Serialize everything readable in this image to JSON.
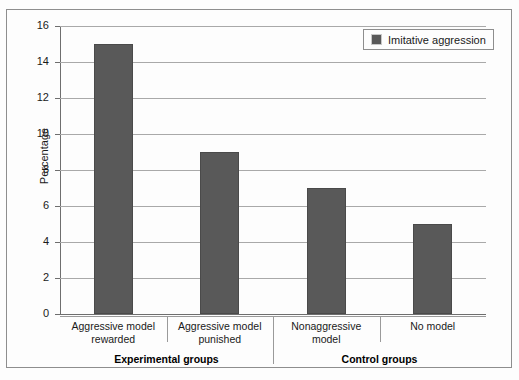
{
  "chart_data": {
    "type": "bar",
    "title": "",
    "subtitle": "",
    "xlabel": "",
    "ylabel": "Percentage",
    "ylim": [
      0,
      16
    ],
    "ytick_step": 2,
    "yticks": [
      0,
      2,
      4,
      6,
      8,
      10,
      12,
      14,
      16
    ],
    "grid": true,
    "legend_position": "top-right",
    "categories": [
      "Aggressive model rewarded",
      "Aggressive model punished",
      "Nonaggressive model",
      "No model"
    ],
    "category_lines": [
      [
        "Aggressive model",
        "rewarded"
      ],
      [
        "Aggressive model",
        "punished"
      ],
      [
        "Nonaggressive",
        "model"
      ],
      [
        "No model"
      ]
    ],
    "series": [
      {
        "name": "Imitative aggression",
        "color": "#595959",
        "values": [
          15,
          9,
          7,
          5
        ]
      }
    ],
    "groups": [
      {
        "label": "Experimental groups",
        "categories": [
          "Aggressive model rewarded",
          "Aggressive model punished"
        ]
      },
      {
        "label": "Control groups",
        "categories": [
          "Nonaggressive model",
          "No model"
        ]
      }
    ]
  },
  "legend": {
    "entries": [
      {
        "label": "Imitative aggression",
        "color": "#595959",
        "swatch_icon": "filled-square-icon"
      }
    ]
  },
  "axes": {
    "y": {
      "title": "Percentage",
      "tick_labels": [
        "0",
        "2",
        "4",
        "6",
        "8",
        "10",
        "12",
        "14",
        "16"
      ]
    }
  },
  "colors": {
    "bar_fill": "#595959",
    "bar_stroke": "#4a4a4a",
    "gridline": "#a9a9a9",
    "axis": "#6e6e6e",
    "frame": "#8e8e8e",
    "background": "#fdfdfd",
    "text": "#1a1a1a"
  }
}
